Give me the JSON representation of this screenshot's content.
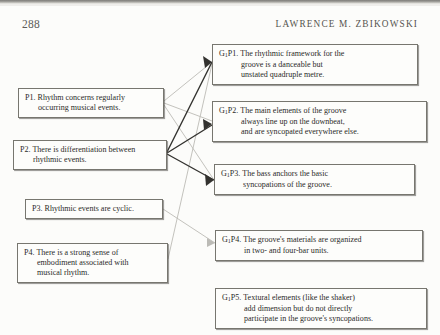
{
  "page": {
    "folio": "288",
    "running_head": "LAWRENCE M. ZBIKOWSKI",
    "background_color": "#fcfcfa",
    "ink_color": "#2c2b29"
  },
  "diagram": {
    "line_colors": {
      "strong": "#2f2e2c",
      "weak": "#b9b8b3"
    },
    "premises": [
      {
        "id": "p1",
        "label": "P1.",
        "lines": [
          "P1. Rhythm concerns regularly",
          "occurring musical events."
        ]
      },
      {
        "id": "p2",
        "label": "P2.",
        "lines": [
          "P2. There is differentiation between",
          "rhythmic events."
        ]
      },
      {
        "id": "p3",
        "label": "P3.",
        "lines": [
          "P3. Rhythmic events are cyclic."
        ]
      },
      {
        "id": "p4",
        "label": "P4.",
        "lines": [
          "P4. There is a strong sense of",
          "embodiment associated with",
          "musical rhythm."
        ]
      }
    ],
    "groove_premises": [
      {
        "id": "g1p1",
        "label": "G1P1.",
        "prefix": "G",
        "sub": "1",
        "head": "P1. The rhythmic framework for the",
        "lines": [
          "groove is a danceable but",
          "unstated quadruple metre."
        ]
      },
      {
        "id": "g1p2",
        "label": "G1P2.",
        "prefix": "G",
        "sub": "1",
        "head": "P2. The main elements of the groove",
        "lines": [
          "always line up on the downbeat,",
          "and are syncopated everywhere else."
        ]
      },
      {
        "id": "g1p3",
        "label": "G1P3.",
        "prefix": "G",
        "sub": "1",
        "head": "P3. The bass anchors the basic",
        "lines": [
          "syncopations of the groove."
        ]
      },
      {
        "id": "g1p4",
        "label": "G1P4.",
        "prefix": "G",
        "sub": "1",
        "head": "P4. The groove's materials are organized",
        "lines": [
          "in two- and four-bar units."
        ]
      },
      {
        "id": "g1p5",
        "label": "G1P5.",
        "prefix": "G",
        "sub": "1",
        "head": "P5. Textural elements (like the shaker)",
        "lines": [
          "add dimension but do not directly",
          "participate in the groove's syncopations."
        ]
      }
    ],
    "connections": [
      {
        "from": "p1",
        "to": "g1p1",
        "weight": "weak"
      },
      {
        "from": "p1",
        "to": "g1p2",
        "weight": "weak"
      },
      {
        "from": "p1",
        "to": "g1p3",
        "weight": "weak"
      },
      {
        "from": "p2",
        "to": "g1p1",
        "weight": "strong"
      },
      {
        "from": "p2",
        "to": "g1p2",
        "weight": "strong"
      },
      {
        "from": "p2",
        "to": "g1p3",
        "weight": "strong"
      },
      {
        "from": "p3",
        "to": "g1p4",
        "weight": "weak"
      },
      {
        "from": "p4",
        "to": "g1p1",
        "weight": "weak"
      }
    ]
  }
}
